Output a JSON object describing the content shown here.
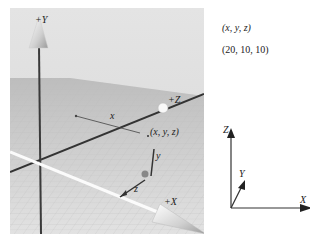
{
  "viewport": {
    "axis_labels": {
      "y": "+Y",
      "z": "+Z",
      "x": "+X"
    },
    "component_labels": {
      "x": "x",
      "y": "y",
      "z": "z"
    },
    "point_label": "(x, y, z)"
  },
  "side_panel": {
    "coord_form": "(x, y, z)",
    "coord_value": "(20, 10, 10)"
  },
  "mini_axes": {
    "z": "Z",
    "y": "Y",
    "x": "X"
  }
}
